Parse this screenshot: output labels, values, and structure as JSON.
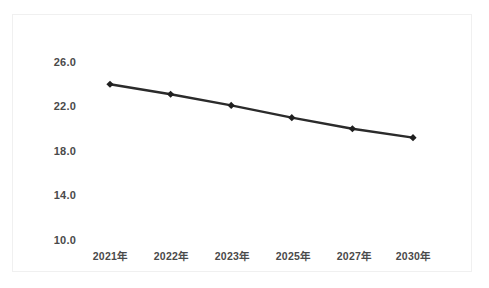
{
  "chart_data": {
    "type": "line",
    "title": "",
    "subtitle": "",
    "xlabel": "",
    "ylabel": "",
    "categories": [
      "2021年",
      "2022年",
      "2023年",
      "2025年",
      "2027年",
      "2030年"
    ],
    "series": [
      {
        "name": "",
        "values": [
          24.0,
          23.1,
          22.1,
          21.0,
          20.0,
          19.2
        ]
      }
    ],
    "ylim": [
      10.0,
      26.0
    ],
    "yticks": [
      "10.0",
      "14.0",
      "18.0",
      "22.0",
      "26.0"
    ],
    "ytick_values": [
      10.0,
      14.0,
      18.0,
      22.0,
      26.0
    ],
    "grid": false,
    "legend": "none",
    "marker": "diamond",
    "line_color": "#2b2b2b",
    "marker_color": "#1f1f1f",
    "background_color": "#ffffff",
    "panel_border_color": "#f0f0f0",
    "tick_label_color": "#4a4a4a"
  },
  "axes": {
    "y_labels": [
      "26.0",
      "22.0",
      "18.0",
      "14.0",
      "10.0"
    ],
    "x_labels": [
      "2021年",
      "2022年",
      "2023年",
      "2025年",
      "2027年",
      "2030年"
    ]
  },
  "caption": {
    "text": ""
  }
}
